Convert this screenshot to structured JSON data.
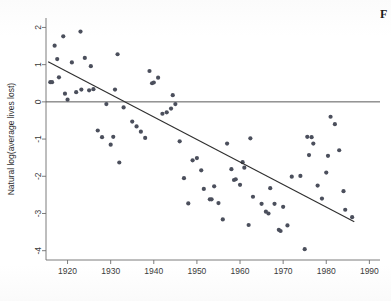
{
  "figure": {
    "corner_caption": "F",
    "background_color": "#ffffff",
    "point_color": "#4b4f5c",
    "line_color": "#2e2e2e",
    "axis_color": "#6e6e6e"
  },
  "chart_data": {
    "type": "scatter",
    "title": "",
    "xlabel": "",
    "ylabel": "Natural log(average lives lost)",
    "xlim": [
      1915,
      1992
    ],
    "ylim": [
      -4.25,
      2.2
    ],
    "xticks": [
      1920,
      1930,
      1940,
      1950,
      1960,
      1970,
      1980,
      1990
    ],
    "xticklabels": [
      "1920",
      "1930",
      "1940",
      "1950",
      "1960",
      "1970",
      "1980",
      "1990"
    ],
    "yticks": [
      2,
      1,
      0,
      -1,
      -2,
      -3,
      -4
    ],
    "yticklabels": [
      "2",
      "1",
      "0",
      "-1",
      "-2",
      "-3",
      "-4"
    ],
    "grid": false,
    "legend": false,
    "reference_lines": [
      {
        "name": "zero-line",
        "orientation": "horizontal",
        "value": 0
      }
    ],
    "fit_line": {
      "name": "linear-trend",
      "x_start": 1915.5,
      "y_start": 1.08,
      "x_end": 1986.5,
      "y_end": -3.22
    },
    "x": [
      1916,
      1916.4,
      1917,
      1917.6,
      1918,
      1919,
      1919.4,
      1920,
      1921,
      1922,
      1923,
      1923.2,
      1924,
      1925,
      1925.4,
      1926,
      1927,
      1928,
      1929,
      1930,
      1930.6,
      1931,
      1931.6,
      1932,
      1933,
      1935,
      1936,
      1937,
      1938,
      1939,
      1939.6,
      1940,
      1941,
      1942,
      1943,
      1944,
      1944.4,
      1945,
      1946,
      1947,
      1948,
      1949,
      1950,
      1951,
      1951.6,
      1953,
      1953.4,
      1954,
      1955,
      1956,
      1957,
      1958,
      1958.6,
      1959,
      1960,
      1960.6,
      1961,
      1962,
      1962.4,
      1963,
      1965,
      1966,
      1966.6,
      1967,
      1968,
      1969,
      1969.4,
      1970,
      1971,
      1972,
      1974,
      1975,
      1975.6,
      1976,
      1976.6,
      1977,
      1978,
      1979,
      1980,
      1980.4,
      1981,
      1982,
      1983,
      1984,
      1984.4,
      1986
    ],
    "y": [
      0.53,
      0.53,
      1.51,
      1.15,
      0.66,
      1.76,
      0.22,
      0.06,
      1.06,
      0.26,
      1.89,
      0.33,
      1.18,
      0.31,
      0.96,
      0.34,
      -0.77,
      -0.95,
      -0.06,
      -1.15,
      -0.94,
      0.33,
      1.28,
      -1.63,
      -0.15,
      -0.53,
      -0.66,
      -0.8,
      -0.97,
      0.83,
      0.5,
      0.52,
      0.65,
      -0.32,
      -0.28,
      -0.18,
      0.18,
      -0.06,
      -1.06,
      -2.05,
      -2.73,
      -1.57,
      -1.51,
      -1.84,
      -2.34,
      -2.62,
      -2.62,
      -2.27,
      -2.72,
      -3.16,
      -1.12,
      -1.81,
      -2.1,
      -2.08,
      -2.23,
      -1.62,
      -1.77,
      -3.31,
      -0.98,
      -2.55,
      -2.74,
      -2.95,
      -3.0,
      -2.32,
      -2.74,
      -3.44,
      -3.47,
      -2.82,
      -3.32,
      -2.01,
      -1.99,
      -3.96,
      -0.94,
      -1.43,
      -0.95,
      -1.12,
      -2.25,
      -2.6,
      -1.9,
      -1.45,
      -0.4,
      -0.6,
      -1.3,
      -2.4,
      -2.9,
      -3.1
    ]
  }
}
